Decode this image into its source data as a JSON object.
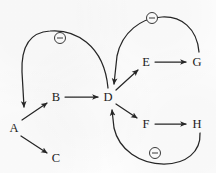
{
  "diagram": {
    "type": "directed-graph",
    "background_color": "#fdfdfd",
    "stroke_color": "#262626",
    "nodes": [
      {
        "id": "A",
        "label": "A",
        "x": 14,
        "y": 128
      },
      {
        "id": "B",
        "label": "B",
        "x": 56,
        "y": 97
      },
      {
        "id": "C",
        "label": "C",
        "x": 56,
        "y": 158
      },
      {
        "id": "D",
        "label": "D",
        "x": 108,
        "y": 97
      },
      {
        "id": "E",
        "label": "E",
        "x": 146,
        "y": 62
      },
      {
        "id": "F",
        "label": "F",
        "x": 146,
        "y": 124
      },
      {
        "id": "G",
        "label": "G",
        "x": 197,
        "y": 62
      },
      {
        "id": "H",
        "label": "H",
        "x": 197,
        "y": 124
      }
    ],
    "edges": [
      {
        "from": "A",
        "to": "B",
        "sign": "",
        "style": "straight"
      },
      {
        "from": "A",
        "to": "C",
        "sign": "",
        "style": "straight"
      },
      {
        "from": "B",
        "to": "D",
        "sign": "",
        "style": "straight"
      },
      {
        "from": "D",
        "to": "E",
        "sign": "",
        "style": "straight"
      },
      {
        "from": "D",
        "to": "F",
        "sign": "",
        "style": "straight"
      },
      {
        "from": "E",
        "to": "G",
        "sign": "",
        "style": "straight"
      },
      {
        "from": "F",
        "to": "H",
        "sign": "",
        "style": "straight"
      },
      {
        "from": "D",
        "to": "A",
        "sign": "-",
        "style": "arc-over-top"
      },
      {
        "from": "G",
        "to": "D",
        "sign": "-",
        "style": "arc-over-top-right"
      },
      {
        "from": "H",
        "to": "D",
        "sign": "-",
        "style": "arc-under-bottom-right"
      }
    ],
    "signs": [
      {
        "id": "sign-da",
        "symbol": "⊖",
        "meaning": "negative",
        "x": 60,
        "y": 38
      },
      {
        "id": "sign-gd",
        "symbol": "⊖",
        "meaning": "negative",
        "x": 152,
        "y": 18
      },
      {
        "id": "sign-hd",
        "symbol": "⊖",
        "meaning": "negative",
        "x": 155,
        "y": 153
      }
    ]
  }
}
